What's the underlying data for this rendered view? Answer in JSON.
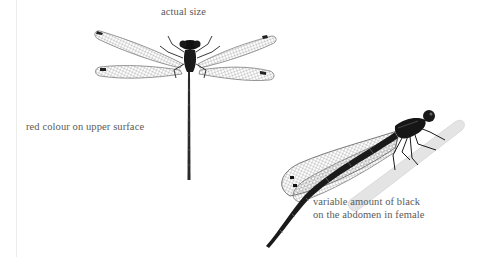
{
  "page": {
    "captions": {
      "actual_size": "actual size",
      "upper_surface": "red colour on upper surface",
      "female_abdomen": {
        "line1": "variable amount of black",
        "line2": "on the abdomen in female"
      }
    },
    "illustrations": [
      {
        "name": "damselfly-dorsal-view",
        "description": "top-down view, wings spread, actual size"
      },
      {
        "name": "damselfly-side-view-female",
        "description": "female perched on a twig, side view"
      }
    ],
    "colors": {
      "caption_text": "#5a5a5a",
      "ink": "#1a1a1a",
      "wing": "#9a9a9a",
      "twig": "#dcdcdc",
      "gutter": "#ececec"
    }
  }
}
